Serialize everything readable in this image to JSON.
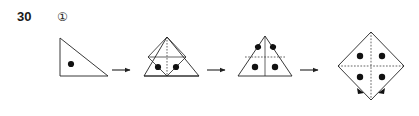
{
  "figure": {
    "problem_number": "30",
    "item_marker": "①",
    "caption": "",
    "type": "paper-unfolding-sequence",
    "stroke_color": "#222222",
    "dot_color": "#111111",
    "background_color": "#ffffff",
    "steps": [
      {
        "index": 1,
        "name": "folded-right-triangle-one-dot",
        "shape": "right-triangle",
        "description": "Right triangle, right angle at bottom-left, hypotenuse from top-left vertex to bottom-right vertex",
        "dot_count": 1,
        "dots": [
          {
            "x": 0.33,
            "y": 0.62
          }
        ],
        "interior_lines": 0
      },
      {
        "index": 2,
        "name": "partial-unfold-two-dots",
        "shape": "isosceles-triangle-with-inner-square",
        "description": "Wider triangle with an inner square (rotated diamond) formed by the fold creases in the left portion",
        "dot_count": 2,
        "dots": [
          {
            "x": 0.33,
            "y": 0.68
          },
          {
            "x": 0.5,
            "y": 0.68
          }
        ],
        "interior_lines": 4
      },
      {
        "index": 3,
        "name": "unfold-four-dots",
        "shape": "isosceles-triangle-with-cross",
        "description": "Isosceles triangle with a vertical crease and a horizontal crease forming a cross",
        "dot_count": 4,
        "dots": [
          {
            "x": 0.42,
            "y": 0.4
          },
          {
            "x": 0.58,
            "y": 0.4
          },
          {
            "x": 0.4,
            "y": 0.7
          },
          {
            "x": 0.6,
            "y": 0.7
          }
        ],
        "interior_lines": 2
      },
      {
        "index": 4,
        "name": "fully-unfolded-square-four-dots",
        "shape": "square-rotated-45-degrees",
        "description": "Fully unfolded square standing on a corner (diamond), with vertical and horizontal creases and four punched holes, plus small fold arrow marks at the lower corner",
        "dot_count": 4,
        "dots": [
          {
            "x": 0.38,
            "y": 0.38
          },
          {
            "x": 0.62,
            "y": 0.38
          },
          {
            "x": 0.38,
            "y": 0.6
          },
          {
            "x": 0.62,
            "y": 0.6
          }
        ],
        "interior_lines": 2
      }
    ],
    "arrows": [
      {
        "index": 1,
        "name": "arrow-step1-to-step2",
        "direction": "right"
      },
      {
        "index": 2,
        "name": "arrow-step2-to-step3",
        "direction": "right"
      },
      {
        "index": 3,
        "name": "arrow-step3-to-step4",
        "direction": "right"
      }
    ]
  }
}
